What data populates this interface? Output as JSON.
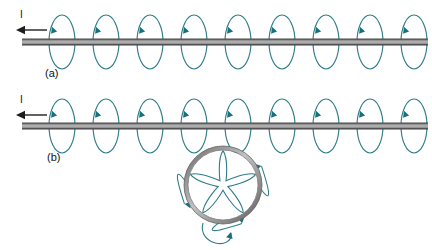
{
  "figure": {
    "background_color": "#ffffff",
    "width": 432,
    "height": 250
  },
  "colors": {
    "field_line": "#2d7d8a",
    "arrow_head": "#17707d",
    "wire_edge": "#555555",
    "wire_core": "#9a9a9a",
    "loop_edge": "#6f6f6f",
    "loop_core": "#b4b4b4",
    "text": "#111111"
  },
  "panels": [
    {
      "id": "panel-a",
      "label": "(a)",
      "label_x": 45,
      "label_y": 77,
      "current_label": "I",
      "current_label_x": 20,
      "current_label_y": 18,
      "current_direction": "left",
      "current_arrow": {
        "x1": 47,
        "y1": 30,
        "x2": 16,
        "y2": 30
      },
      "wire": {
        "x1": 22,
        "y1": 42,
        "x2": 428,
        "y2": 42,
        "thickness": 6
      },
      "loop_count": 9,
      "loop_first_cx": 62,
      "loop_spacing": 44,
      "loop_rx": 13,
      "loop_ry": 27,
      "has_circular_loop": false
    },
    {
      "id": "panel-b",
      "label": "(b)",
      "label_x": 47,
      "label_y": 161,
      "current_label": "I",
      "current_label_x": 20,
      "current_label_y": 103,
      "current_direction": "left",
      "current_arrow": {
        "x1": 47,
        "y1": 115,
        "x2": 16,
        "y2": 115
      },
      "wire": {
        "x1": 22,
        "y1": 126,
        "x2": 428,
        "y2": 126,
        "thickness": 6
      },
      "loop_count": 9,
      "loop_first_cx": 62,
      "loop_spacing": 44,
      "loop_rx": 13,
      "loop_ry": 27,
      "has_circular_loop": true,
      "circular_loop": {
        "cx": 223,
        "cy": 185,
        "r": 37,
        "thickness": 4,
        "petal_count": 5,
        "description": "current loop in plane perpendicular to wire"
      }
    }
  ],
  "annotations": {
    "field_line_shape": "ellipse",
    "arrowhead_position": "top-left of each ellipse",
    "arrowhead_direction": "counterclockwise-into-page"
  }
}
